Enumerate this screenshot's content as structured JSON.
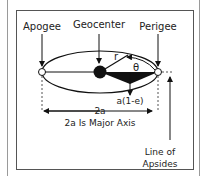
{
  "diagram": {
    "labels": {
      "apogee": "Apogee",
      "geocenter": "Geocenter",
      "perigee": "Perigee",
      "radius": "r",
      "angle": "θ",
      "distance": "a(1-e)",
      "major_axis_short": "2a",
      "major_axis_caption": "2a Is Major Axis",
      "line_of_apsides_1": "Line of",
      "line_of_apsides_2": "Apsides"
    }
  }
}
